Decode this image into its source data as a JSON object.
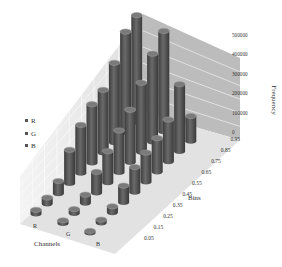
{
  "chart_data": {
    "type": "bar",
    "subtype": "3d-column",
    "title": "",
    "xlabel": "Bins",
    "ylabel": "Frequency",
    "zlabel": "Channels",
    "categories": [
      "0.05",
      "0.15",
      "0.25",
      "0.35",
      "0.45",
      "0.55",
      "0.65",
      "0.75",
      "0.85",
      "0.95"
    ],
    "series": [
      {
        "name": "R",
        "values": [
          20000,
          30000,
          60000,
          160000,
          230000,
          280000,
          300000,
          380000,
          480000,
          510000
        ]
      },
      {
        "name": "G",
        "values": [
          15000,
          20000,
          40000,
          100000,
          150000,
          200000,
          250000,
          330000,
          420000,
          480000
        ]
      },
      {
        "name": "B",
        "values": [
          10000,
          15000,
          30000,
          80000,
          120000,
          140000,
          160000,
          200000,
          320000,
          120000
        ]
      }
    ],
    "ylim": [
      0,
      500000
    ],
    "yticks": [
      "0",
      "100000",
      "200000",
      "300000",
      "400000",
      "500000"
    ],
    "grid": true,
    "legend": {
      "position": "left",
      "entries": [
        "R",
        "G",
        "B"
      ]
    }
  },
  "legend": {
    "items": [
      "R",
      "G",
      "B"
    ]
  },
  "axes": {
    "channels_label": "Channels",
    "bins_label": "Bins",
    "frequency_label": "Frequency"
  },
  "colors": {
    "column": "#5a5a5a",
    "column_top": "#7a7a7a",
    "back_wall": "#b8b8b8",
    "side_wall": "#e8e8e8",
    "floor": "#dcdcdc",
    "grid": "#ffffff"
  }
}
